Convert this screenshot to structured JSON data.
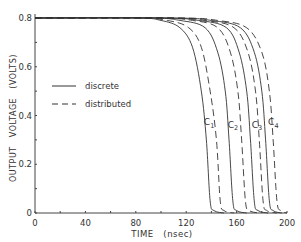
{
  "chart_data": {
    "type": "line",
    "title": "",
    "xlabel": "TIME   (nsec)",
    "ylabel": "OUTPUT   VOLTAGE   (VOLTS)",
    "xlim": [
      0,
      200
    ],
    "ylim": [
      0,
      0.8
    ],
    "xticks": [
      0,
      40,
      80,
      120,
      160,
      200
    ],
    "xtick_labels": [
      "0",
      "40",
      "80",
      "120",
      "160",
      "200"
    ],
    "yticks": [
      0,
      0.2,
      0.4,
      0.6,
      0.8
    ],
    "ytick_labels": [
      "0",
      "0.2",
      "0.4",
      "0.6",
      "0.8"
    ],
    "grid": false,
    "legend": {
      "position": "left-middle",
      "entries": [
        {
          "label": "discrete",
          "style": "solid"
        },
        {
          "label": "distributed",
          "style": "dashed"
        }
      ]
    },
    "annotations": [
      "C1",
      "C2",
      "C3",
      "C4"
    ],
    "series": [
      {
        "name": "C1 discrete",
        "style": "solid",
        "x": [
          0,
          80,
          100,
          115,
          125,
          132,
          136,
          139,
          142,
          150
        ],
        "y": [
          0.8,
          0.8,
          0.79,
          0.76,
          0.68,
          0.5,
          0.3,
          0.05,
          0.01,
          0.0
        ]
      },
      {
        "name": "C1 distributed",
        "style": "dashed",
        "x": [
          0,
          80,
          105,
          122,
          132,
          139,
          144,
          147,
          150,
          158
        ],
        "y": [
          0.8,
          0.8,
          0.79,
          0.76,
          0.68,
          0.5,
          0.3,
          0.05,
          0.01,
          0.0
        ]
      },
      {
        "name": "C2 discrete",
        "style": "solid",
        "x": [
          0,
          90,
          115,
          135,
          145,
          151,
          154,
          157,
          160,
          168
        ],
        "y": [
          0.8,
          0.8,
          0.79,
          0.76,
          0.66,
          0.5,
          0.3,
          0.05,
          0.01,
          0.0
        ]
      },
      {
        "name": "C2 distributed",
        "style": "dashed",
        "x": [
          0,
          95,
          125,
          145,
          155,
          161,
          164,
          167,
          170,
          178
        ],
        "y": [
          0.8,
          0.8,
          0.79,
          0.76,
          0.66,
          0.5,
          0.3,
          0.05,
          0.01,
          0.0
        ]
      },
      {
        "name": "C3 discrete",
        "style": "solid",
        "x": [
          0,
          100,
          130,
          152,
          162,
          168,
          171,
          174,
          177,
          185
        ],
        "y": [
          0.8,
          0.8,
          0.79,
          0.76,
          0.66,
          0.5,
          0.3,
          0.05,
          0.01,
          0.0
        ]
      },
      {
        "name": "C3 distributed",
        "style": "dashed",
        "x": [
          0,
          105,
          135,
          158,
          169,
          175,
          178,
          181,
          184,
          192
        ],
        "y": [
          0.8,
          0.8,
          0.79,
          0.76,
          0.66,
          0.5,
          0.3,
          0.05,
          0.01,
          0.0
        ]
      },
      {
        "name": "C4 discrete",
        "style": "solid",
        "x": [
          0,
          110,
          140,
          163,
          174,
          180,
          183,
          186,
          189,
          196
        ],
        "y": [
          0.8,
          0.8,
          0.79,
          0.76,
          0.66,
          0.5,
          0.3,
          0.05,
          0.01,
          0.0
        ]
      },
      {
        "name": "C4 distributed",
        "style": "dashed",
        "x": [
          0,
          115,
          145,
          168,
          180,
          186,
          189,
          192,
          195,
          200
        ],
        "y": [
          0.8,
          0.8,
          0.79,
          0.76,
          0.66,
          0.5,
          0.3,
          0.05,
          0.01,
          0.0
        ]
      }
    ],
    "curve_labels": [
      {
        "text": "C",
        "sub": "1",
        "x": 134,
        "y": 0.36
      },
      {
        "text": "C",
        "sub": "2",
        "x": 153,
        "y": 0.35
      },
      {
        "text": "C",
        "sub": "3",
        "x": 172,
        "y": 0.35
      },
      {
        "text": "C",
        "sub": "4",
        "x": 185,
        "y": 0.36
      }
    ]
  },
  "axis": {
    "xlabel": "TIME   (nsec)",
    "ylabel": "OUTPUT   VOLTAGE   (VOLTS)"
  },
  "legend": {
    "discrete": "discrete",
    "distributed": "distributed"
  }
}
